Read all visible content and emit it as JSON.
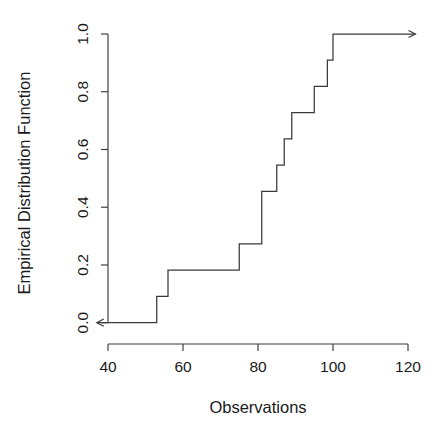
{
  "chart_data": {
    "type": "line",
    "subtype": "ecdf-step",
    "title": "",
    "xlabel": "Observations",
    "ylabel": "Empirical Distribution Function",
    "xlim": [
      36,
      123
    ],
    "ylim": [
      0.0,
      1.0
    ],
    "xticks": [
      40,
      60,
      80,
      100,
      120
    ],
    "xtick_labels": [
      "40",
      "60",
      "80",
      "100",
      "120"
    ],
    "yticks": [
      0.0,
      0.2,
      0.4,
      0.6,
      0.8,
      1.0
    ],
    "ytick_labels": [
      "0.0",
      "0.2",
      "0.4",
      "0.6",
      "0.8",
      "1.0"
    ],
    "grid": false,
    "legend": false,
    "n": 11,
    "x": [
      53,
      56,
      75,
      81,
      85,
      87,
      89,
      95,
      97,
      98.5,
      100
    ],
    "y": [
      0.0909,
      0.1818,
      0.2727,
      0.4545,
      0.5455,
      0.6364,
      0.7273,
      0.8182,
      0.8182,
      0.9091,
      1.0
    ],
    "steps": [
      {
        "x": 53,
        "from": 0.0,
        "to": 0.0909
      },
      {
        "x": 56,
        "from": 0.0909,
        "to": 0.1818
      },
      {
        "x": 75,
        "from": 0.1818,
        "to": 0.2727
      },
      {
        "x": 81,
        "from": 0.2727,
        "to": 0.4545
      },
      {
        "x": 85,
        "from": 0.4545,
        "to": 0.5455
      },
      {
        "x": 87,
        "from": 0.5455,
        "to": 0.6364
      },
      {
        "x": 89,
        "from": 0.6364,
        "to": 0.7273
      },
      {
        "x": 95,
        "from": 0.7273,
        "to": 0.8182
      },
      {
        "x": 98.5,
        "from": 0.8182,
        "to": 0.9091
      },
      {
        "x": 100,
        "from": 0.9091,
        "to": 1.0
      }
    ],
    "left_tail": {
      "y": 0.0,
      "from_x": 53,
      "to_x": 37,
      "arrow": "left"
    },
    "right_tail": {
      "y": 1.0,
      "from_x": 100,
      "to_x": 122,
      "arrow": "right"
    },
    "line_color": "#3a3a3a",
    "background_color": "#ffffff"
  }
}
